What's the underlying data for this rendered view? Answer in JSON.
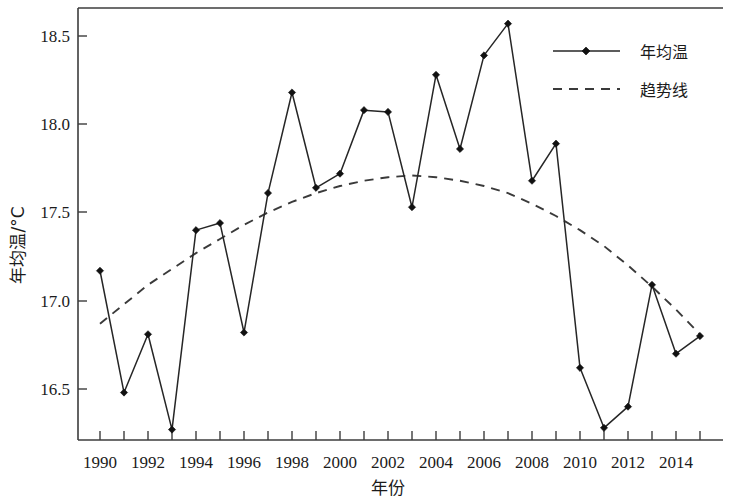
{
  "figure": {
    "background_color": "#ffffff",
    "line_color": "#262626",
    "trend_color": "#3a3a3a",
    "axis_color": "#3c3c3c"
  },
  "axis": {
    "x_title": "年份",
    "y_title": "年均温/°C",
    "y_tick_labels": [
      "18.5",
      "18.0",
      "17.5",
      "17.0",
      "16.5"
    ],
    "x_tick_labels": [
      "1990",
      "1992",
      "1994",
      "1996",
      "1998",
      "2000",
      "2002",
      "2004",
      "2006",
      "2008",
      "2010",
      "2012",
      "2014"
    ]
  },
  "legend": {
    "items": [
      {
        "label": "年均温",
        "style": "solid-with-marker"
      },
      {
        "label": "趋势线",
        "style": "dashed"
      }
    ]
  },
  "chart_data": {
    "type": "line",
    "title": "",
    "xlabel": "年份",
    "ylabel": "年均温/°C",
    "xlim": [
      1989.3,
      2015.6
    ],
    "ylim": [
      16.2,
      18.67
    ],
    "grid": false,
    "legend_position": "top-right",
    "x": [
      1990,
      1991,
      1992,
      1993,
      1994,
      1995,
      1996,
      1997,
      1998,
      1999,
      2000,
      2001,
      2002,
      2003,
      2004,
      2005,
      2006,
      2007,
      2008,
      2009,
      2010,
      2011,
      2012,
      2013,
      2014,
      2015
    ],
    "series": [
      {
        "name": "年均温",
        "style": "solid",
        "marker": "diamond",
        "values": [
          17.17,
          16.48,
          16.81,
          16.27,
          17.4,
          17.44,
          16.82,
          17.61,
          18.18,
          17.64,
          17.72,
          18.08,
          18.07,
          17.53,
          18.28,
          17.86,
          18.39,
          18.57,
          17.68,
          17.89,
          16.62,
          16.28,
          16.4,
          17.09,
          16.7,
          16.8
        ]
      },
      {
        "name": "趋势线",
        "style": "dashed",
        "marker": "none",
        "values": [
          16.87,
          16.98,
          17.09,
          17.18,
          17.27,
          17.35,
          17.43,
          17.5,
          17.56,
          17.61,
          17.65,
          17.68,
          17.7,
          17.71,
          17.7,
          17.68,
          17.65,
          17.61,
          17.55,
          17.48,
          17.4,
          17.31,
          17.2,
          17.08,
          16.95,
          16.81
        ]
      }
    ],
    "y_ticks": [
      16.5,
      17.0,
      17.5,
      18.0,
      18.5
    ],
    "x_ticks": [
      1990,
      1991,
      1992,
      1993,
      1994,
      1995,
      1996,
      1997,
      1998,
      1999,
      2000,
      2001,
      2002,
      2003,
      2004,
      2005,
      2006,
      2007,
      2008,
      2009,
      2010,
      2011,
      2012,
      2013,
      2014,
      2015
    ],
    "x_tick_labeled": [
      1990,
      1992,
      1994,
      1996,
      1998,
      2000,
      2002,
      2004,
      2006,
      2008,
      2010,
      2012,
      2014
    ]
  }
}
